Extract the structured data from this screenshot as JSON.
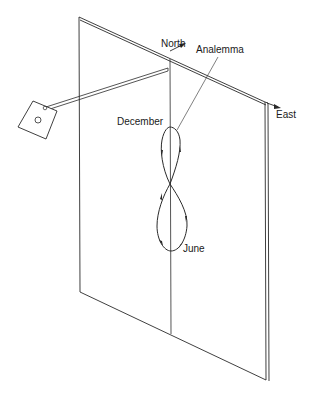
{
  "diagram": {
    "type": "sundial-analemma-wall",
    "labels": {
      "north": "North",
      "analemma": "Analemma",
      "east": "East",
      "december": "December",
      "june": "June"
    },
    "colors": {
      "stroke": "#2a2a2a",
      "background": "#ffffff"
    }
  }
}
